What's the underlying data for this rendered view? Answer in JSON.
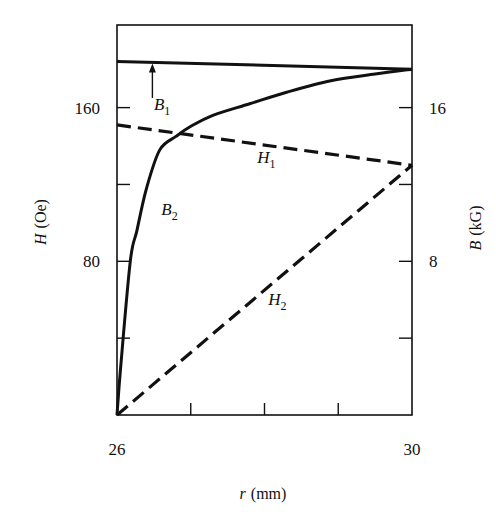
{
  "chart_data": {
    "type": "line",
    "title": "",
    "xlabel": "r (mm)",
    "xlabel_var": "r",
    "xlabel_unit": "(mm)",
    "ylabel_left": "H (Oe)",
    "ylabel_left_var": "H",
    "ylabel_left_unit": "(Oe)",
    "ylabel_right": "B (kG)",
    "ylabel_right_var": "B",
    "ylabel_right_unit": "(kG)",
    "xlim": [
      26,
      30
    ],
    "ylim_left": [
      0,
      203
    ],
    "ylim_right": [
      0,
      20.3
    ],
    "xticks": [
      26,
      27,
      28,
      29,
      30
    ],
    "xtick_labels": [
      {
        "value": 26,
        "label": "26"
      },
      {
        "value": 30,
        "label": "30"
      }
    ],
    "yticks_left": [
      0,
      40,
      80,
      120,
      160
    ],
    "ytick_labels_left": [
      {
        "value": 80,
        "label": "80"
      },
      {
        "value": 160,
        "label": "160"
      }
    ],
    "yticks_right": [
      0,
      4,
      8,
      12,
      16
    ],
    "ytick_labels_right": [
      {
        "value": 8,
        "label": "8"
      },
      {
        "value": 16,
        "label": "16"
      }
    ],
    "grid": false,
    "legend": "none (inline curve labels)",
    "series": [
      {
        "name": "B1",
        "label_main": "B",
        "label_sub": "1",
        "axis": "right",
        "style": "solid",
        "x": [
          26,
          30
        ],
        "y": [
          18.4,
          18.0
        ],
        "label_pos": [
          26.5,
          15.9
        ],
        "arrow": {
          "from": [
            26.48,
            16.5
          ],
          "to": [
            26.48,
            18.3
          ]
        }
      },
      {
        "name": "B2",
        "label_main": "B",
        "label_sub": "2",
        "axis": "right",
        "style": "solid",
        "x": [
          26,
          26.05,
          26.18,
          26.27,
          26.4,
          26.58,
          26.8,
          26.99,
          27.3,
          27.8,
          28.3,
          28.9,
          29.5,
          30
        ],
        "y": [
          0,
          2.5,
          8.0,
          9.6,
          11.8,
          13.8,
          14.5,
          15.0,
          15.6,
          16.2,
          16.8,
          17.4,
          17.75,
          18.0
        ],
        "label_pos": [
          26.6,
          10.4
        ]
      },
      {
        "name": "H1",
        "label_main": "H",
        "label_sub": "1",
        "axis": "left",
        "style": "dashed",
        "x": [
          26,
          30
        ],
        "y": [
          151,
          130
        ],
        "label_pos": [
          27.9,
          131
        ]
      },
      {
        "name": "H2",
        "label_main": "H",
        "label_sub": "2",
        "axis": "left",
        "style": "dashed",
        "x": [
          26,
          30
        ],
        "y": [
          0,
          130
        ],
        "label_pos": [
          28.05,
          57
        ]
      }
    ]
  },
  "colors": {
    "ink": "#111111",
    "background": "#ffffff"
  }
}
